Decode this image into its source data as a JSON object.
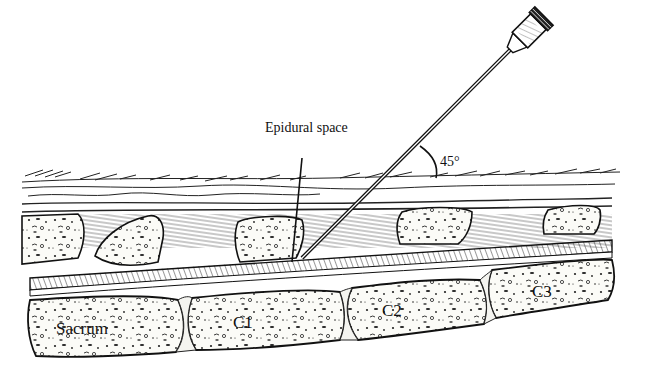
{
  "figure": {
    "type": "anatomical line illustration",
    "colors": {
      "ink": "#111111",
      "paper": "#ffffff",
      "bone_fill": "#fbfbf7",
      "hatch": "#333333"
    }
  },
  "labels": {
    "epidural_space": "Epidural space",
    "angle": "45°",
    "sacrum": "Sacrum",
    "c1": "C1",
    "c2": "C2",
    "c3": "C3"
  },
  "annotations": {
    "needle_angle_degrees": 45
  }
}
